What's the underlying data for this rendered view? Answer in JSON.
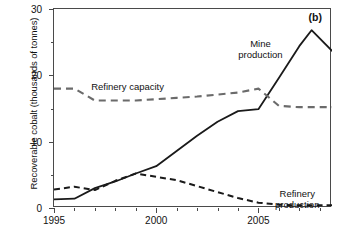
{
  "chart_data": {
    "type": "line",
    "title": "",
    "panel_label": "(b)",
    "xlabel": "",
    "ylabel": "Recoverable cobalt (thousands of tonnes)",
    "xlim": [
      1995,
      2008.6
    ],
    "ylim": [
      0,
      30
    ],
    "x_major_ticks": [
      1995,
      2000,
      2005
    ],
    "x_major_tick_labels": [
      "1995",
      "2000",
      "2005"
    ],
    "x_minor_ticks": [
      1996,
      1997,
      1998,
      1999,
      2001,
      2002,
      2003,
      2004,
      2006,
      2007,
      2008
    ],
    "y_major_ticks": [
      0,
      10,
      20,
      30
    ],
    "y_major_tick_labels": [
      "0",
      "10",
      "20",
      "30"
    ],
    "y_minor_ticks": [
      5,
      15,
      25
    ],
    "grid": false,
    "legend_position": "inline-annotations",
    "series": [
      {
        "name": "Mine production",
        "style": "solid",
        "color": "#1a1a1a",
        "x": [
          1995,
          1996,
          1997,
          1998,
          1999,
          2000,
          2001,
          2002,
          2003,
          2004,
          2005,
          2006,
          2007,
          2007.6,
          2008.6
        ],
        "values": [
          1.3,
          1.4,
          3.0,
          4.0,
          5.2,
          6.3,
          8.6,
          10.9,
          13.0,
          14.6,
          14.9,
          19.6,
          24.4,
          26.8,
          23.7
        ]
      },
      {
        "name": "Refinery capacity",
        "style": "dashed",
        "color": "#6b6b6b",
        "x": [
          1995,
          1996,
          1997,
          1998,
          1999,
          2000,
          2001,
          2002,
          2003,
          2004,
          2005,
          2006,
          2007,
          2008.6
        ],
        "values": [
          18.0,
          18.0,
          16.2,
          16.2,
          16.2,
          16.4,
          16.6,
          16.8,
          17.1,
          17.4,
          18.0,
          15.4,
          15.2,
          15.2
        ]
      },
      {
        "name": "Refinery production",
        "style": "dashed",
        "color": "#1a1a1a",
        "x": [
          1995,
          1996,
          1997,
          1998,
          1999,
          2000,
          2001,
          2002,
          2003,
          2004,
          2005,
          2006,
          2007,
          2008.6
        ],
        "values": [
          2.8,
          3.2,
          2.7,
          4.1,
          5.2,
          4.7,
          4.2,
          3.3,
          2.4,
          1.5,
          0.8,
          0.5,
          0.4,
          0.4
        ]
      }
    ],
    "annotations": [
      {
        "text_line1": "Mine",
        "text_line2": "production",
        "x": 2005.1,
        "y": 25.6
      },
      {
        "text_line1": "Refinery capacity",
        "text_line2": "",
        "x": 1998.6,
        "y": 19.1
      },
      {
        "text_line1": "Refinery",
        "text_line2": "production",
        "x": 2006.9,
        "y": 3.0
      }
    ]
  }
}
